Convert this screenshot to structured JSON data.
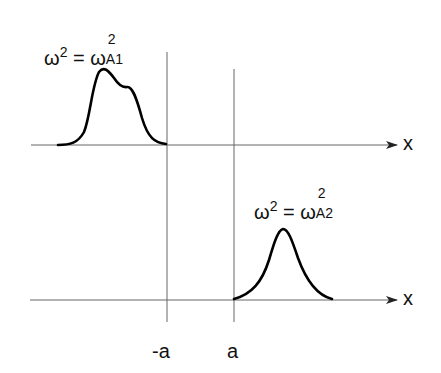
{
  "diagram": {
    "panels": [
      {
        "equation": {
          "lhs": "ω",
          "lhs_sup": "2",
          "eq": "=",
          "rhs": "ω",
          "rhs_sup": "2",
          "rhs_sub": "A1"
        },
        "axis_label": "x",
        "curve": "double-hump mode localized to x < -a"
      },
      {
        "equation": {
          "lhs": "ω",
          "lhs_sup": "2",
          "eq": "=",
          "rhs": "ω",
          "rhs_sup": "2",
          "rhs_sub": "A2"
        },
        "axis_label": "x",
        "curve": "single Gaussian-like mode localized to x > a"
      }
    ],
    "markers": [
      {
        "label": "-a"
      },
      {
        "label": "a"
      }
    ],
    "colors": {
      "curve": "#000000",
      "axis": "#666666"
    }
  }
}
